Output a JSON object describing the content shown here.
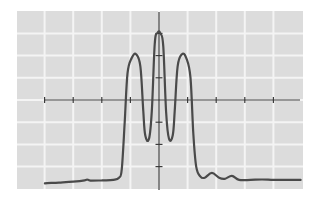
{
  "chart_data": {
    "type": "line",
    "title": "",
    "xlabel": "",
    "ylabel": "",
    "grid": true,
    "legend": null,
    "x_unit_px": 28.6,
    "y_unit_px": 22.2,
    "xlim": [
      -5,
      5
    ],
    "ylim": [
      -4,
      4
    ],
    "axes_origin_px": [
      159,
      100
    ],
    "plot_area_px": {
      "left": 17,
      "top": 11,
      "right": 303,
      "bottom": 189
    },
    "x_axis_px": {
      "from": 45,
      "to": 300
    },
    "y_axis_px": {
      "from": 12,
      "to": 190
    },
    "x_ticks": [
      -4,
      -3,
      -2,
      -1,
      1,
      2,
      3,
      4
    ],
    "y_ticks": [
      -3,
      -2,
      -1,
      1,
      2,
      3
    ],
    "series": [
      {
        "name": "signal",
        "color": "#4a4a4a",
        "points": [
          [
            -3.99,
            -3.75
          ],
          [
            -3.5,
            -3.72
          ],
          [
            -3.0,
            -3.68
          ],
          [
            -2.6,
            -3.62
          ],
          [
            -2.5,
            -3.58
          ],
          [
            -2.4,
            -3.63
          ],
          [
            -2.0,
            -3.62
          ],
          [
            -1.6,
            -3.6
          ],
          [
            -1.4,
            -3.5
          ],
          [
            -1.3,
            -3.1
          ],
          [
            -1.2,
            -1.0
          ],
          [
            -1.1,
            1.2
          ],
          [
            -0.95,
            1.9
          ],
          [
            -0.8,
            2.06
          ],
          [
            -0.65,
            1.5
          ],
          [
            -0.55,
            -0.5
          ],
          [
            -0.48,
            -1.6
          ],
          [
            -0.35,
            -1.75
          ],
          [
            -0.25,
            -0.5
          ],
          [
            -0.15,
            2.5
          ],
          [
            -0.05,
            3.03
          ],
          [
            0.05,
            3.0
          ],
          [
            0.15,
            2.4
          ],
          [
            0.25,
            -0.6
          ],
          [
            0.35,
            -1.75
          ],
          [
            0.48,
            -1.6
          ],
          [
            0.55,
            -0.5
          ],
          [
            0.65,
            1.5
          ],
          [
            0.8,
            2.06
          ],
          [
            0.95,
            1.9
          ],
          [
            1.1,
            1.0
          ],
          [
            1.2,
            -1.5
          ],
          [
            1.3,
            -3.0
          ],
          [
            1.45,
            -3.45
          ],
          [
            1.6,
            -3.5
          ],
          [
            1.85,
            -3.28
          ],
          [
            2.1,
            -3.5
          ],
          [
            2.3,
            -3.55
          ],
          [
            2.55,
            -3.42
          ],
          [
            2.8,
            -3.6
          ],
          [
            3.2,
            -3.6
          ],
          [
            3.6,
            -3.58
          ],
          [
            4.0,
            -3.6
          ],
          [
            4.5,
            -3.6
          ],
          [
            4.95,
            -3.6
          ]
        ]
      }
    ]
  },
  "colors": {
    "plot_background": "#dcdcdc",
    "grid_lines": "#f4f4f4",
    "axes": "#3a3a3a",
    "curve": "#4a4a4a"
  }
}
